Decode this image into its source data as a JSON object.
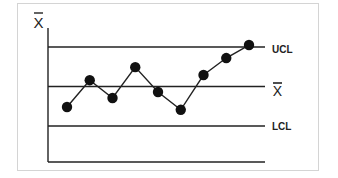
{
  "chart_data": {
    "type": "line",
    "ylabel": "X̄",
    "xlabel": "",
    "control_lines": [
      {
        "name": "UCL",
        "label": "UCL",
        "value": 2.0
      },
      {
        "name": "center",
        "label": "X̄",
        "value": 1.0
      },
      {
        "name": "LCL",
        "label": "LCL",
        "value": 0.0
      }
    ],
    "x": [
      1,
      2,
      3,
      4,
      5,
      6,
      7,
      8,
      9
    ],
    "series": [
      {
        "name": "Sample means",
        "values": [
          0.48,
          1.16,
          0.71,
          1.49,
          0.86,
          0.41,
          1.29,
          1.72,
          2.05
        ]
      }
    ],
    "ylim": [
      -0.9,
      2.5
    ],
    "grid": false,
    "legend": "none (labels at right of lines)",
    "annotations": [
      "Last point reaches the UCL"
    ]
  },
  "colors": {
    "line": "#222222",
    "point": "#111111",
    "border": "#d4d4d4"
  },
  "labels": {
    "y_axis": "X",
    "ucl": "UCL",
    "center": "X",
    "lcl": "LCL"
  }
}
